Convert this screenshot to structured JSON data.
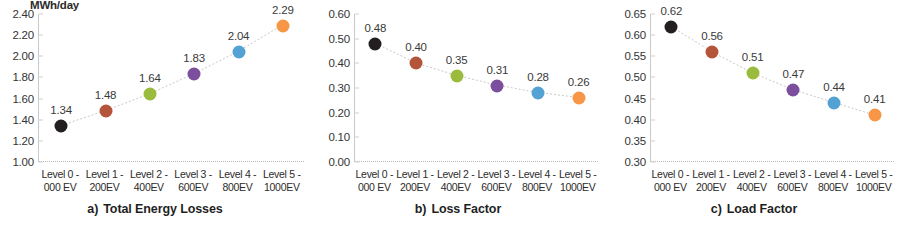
{
  "figure": {
    "panels": [
      {
        "key": "a",
        "title_prefix": "a)",
        "title_text": "Total Energy Losses",
        "unit_label": "MWh/day"
      },
      {
        "key": "b",
        "title_prefix": "b)",
        "title_text": "Loss Factor",
        "unit_label": ""
      },
      {
        "key": "c",
        "title_prefix": "c)",
        "title_text": "Load Factor",
        "unit_label": ""
      }
    ]
  },
  "categories_wrapped": [
    {
      "l1": "Level 0 -",
      "l2": "000 EV"
    },
    {
      "l1": "Level 1 -",
      "l2": "200EV"
    },
    {
      "l1": "Level 2 -",
      "l2": "400EV"
    },
    {
      "l1": "Level 3 -",
      "l2": "600EV"
    },
    {
      "l1": "Level 4 -",
      "l2": "800EV"
    },
    {
      "l1": "Level 5 -",
      "l2": "1000EV"
    }
  ],
  "point_colors": [
    "#231f20",
    "#b4543a",
    "#9bbb3c",
    "#7b4f9d",
    "#54a2d4",
    "#f79646"
  ],
  "chart_data": [
    {
      "type": "scatter",
      "title": "a) Total Energy Losses",
      "xlabel": "",
      "ylabel": "MWh/day",
      "categories": [
        "Level 0 - 000 EV",
        "Level 1 - 200EV",
        "Level 2 - 400EV",
        "Level 3 - 600EV",
        "Level 4 - 800EV",
        "Level 5 - 1000EV"
      ],
      "values": [
        1.34,
        1.48,
        1.64,
        1.83,
        2.04,
        2.29
      ],
      "data_labels": [
        "1.34",
        "1.48",
        "1.64",
        "1.83",
        "2.04",
        "2.29"
      ],
      "ylim": [
        1.0,
        2.4
      ],
      "yticks": [
        1.0,
        1.2,
        1.4,
        1.6,
        1.8,
        2.0,
        2.2,
        2.4
      ],
      "ytick_labels": [
        "1.00",
        "1.20",
        "1.40",
        "1.60",
        "1.80",
        "2.00",
        "2.20",
        "2.40"
      ],
      "grid": false,
      "legend": "none",
      "connector": "dotted"
    },
    {
      "type": "scatter",
      "title": "b) Loss Factor",
      "xlabel": "",
      "ylabel": "",
      "categories": [
        "Level 0 - 000 EV",
        "Level 1 - 200EV",
        "Level 2 - 400EV",
        "Level 3 - 600EV",
        "Level 4 - 800EV",
        "Level 5 - 1000EV"
      ],
      "values": [
        0.48,
        0.4,
        0.35,
        0.31,
        0.28,
        0.26
      ],
      "data_labels": [
        "0.48",
        "0.40",
        "0.35",
        "0.31",
        "0.28",
        "0.26"
      ],
      "ylim": [
        0.0,
        0.6
      ],
      "yticks": [
        0.0,
        0.1,
        0.2,
        0.3,
        0.4,
        0.5,
        0.6
      ],
      "ytick_labels": [
        "0.00",
        "0.10",
        "0.20",
        "0.30",
        "0.40",
        "0.50",
        "0.60"
      ],
      "grid": false,
      "legend": "none",
      "connector": "dotted"
    },
    {
      "type": "scatter",
      "title": "c) Load Factor",
      "xlabel": "",
      "ylabel": "",
      "categories": [
        "Level 0 - 000 EV",
        "Level 1 - 200EV",
        "Level 2 - 400EV",
        "Level 3 - 600EV",
        "Level 4 - 800EV",
        "Level 5 - 1000EV"
      ],
      "values": [
        0.62,
        0.56,
        0.51,
        0.47,
        0.44,
        0.41
      ],
      "data_labels": [
        "0.62",
        "0.56",
        "0.51",
        "0.47",
        "0.44",
        "0.41"
      ],
      "ylim": [
        0.3,
        0.65
      ],
      "yticks": [
        0.3,
        0.35,
        0.4,
        0.45,
        0.5,
        0.55,
        0.6,
        0.65
      ],
      "ytick_labels": [
        "0.30",
        "0.35",
        "0.40",
        "0.45",
        "0.50",
        "0.55",
        "0.60",
        "0.65"
      ],
      "grid": false,
      "legend": "none",
      "connector": "dotted"
    }
  ]
}
